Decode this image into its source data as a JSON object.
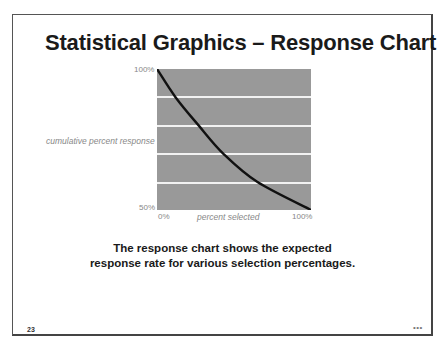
{
  "slide": {
    "title": "Statistical Graphics – Response Chart",
    "caption_line1": "The response chart shows the expected",
    "caption_line2": "response rate for various selection percentages.",
    "page_number": "23",
    "footer_mark": "•••"
  },
  "chart": {
    "y_top_label": "100%",
    "y_bottom_label": "50%",
    "x_left_label": "0%",
    "x_right_label": "100%",
    "ylabel": "cumulative percent response",
    "xlabel": "percent selected",
    "plot_color": "#999999",
    "grid_color": "#f2f2f2",
    "line_color": "#111111"
  },
  "chart_data": {
    "type": "line",
    "title": "Statistical Graphics – Response Chart",
    "xlabel": "percent selected",
    "ylabel": "cumulative percent response",
    "xlim": [
      0,
      100
    ],
    "ylim": [
      50,
      100
    ],
    "x_tick_labels": [
      "0%",
      "100%"
    ],
    "y_tick_labels": [
      "50%",
      "100%"
    ],
    "grid": true,
    "gridlines_y": [
      60,
      70,
      80,
      90
    ],
    "legend": null,
    "series": [
      {
        "name": "response",
        "x": [
          0,
          12,
          27,
          43,
          65,
          100
        ],
        "y": [
          100,
          90,
          80,
          70,
          60,
          50
        ]
      }
    ]
  }
}
